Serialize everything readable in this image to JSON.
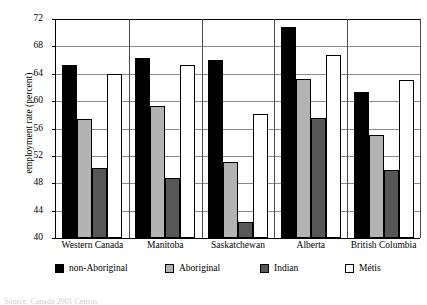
{
  "chart_data": {
    "type": "bar",
    "title": "",
    "xlabel": "",
    "ylabel": "employment rate (percent)",
    "ylim": [
      40,
      72
    ],
    "ytick_step": 4,
    "yticks": [
      72,
      68,
      64,
      60,
      56,
      52,
      48,
      44,
      40
    ],
    "grid": true,
    "legend_position": "bottom",
    "categories": [
      "Western Canada",
      "Manitoba",
      "Saskatchewan",
      "Alberta",
      "British Columbia"
    ],
    "series": [
      {
        "name": "non-Aboriginal",
        "color": "#000000",
        "values": [
          65.0,
          66.0,
          65.7,
          70.5,
          61.0
        ]
      },
      {
        "name": "Aboriginal",
        "color": "#b3b3b3",
        "values": [
          57.1,
          59.0,
          50.8,
          63.0,
          54.7
        ]
      },
      {
        "name": "Indian",
        "color": "#575757",
        "values": [
          50.0,
          48.5,
          42.0,
          57.3,
          49.7
        ]
      },
      {
        "name": "Métis",
        "color": "#ffffff",
        "values": [
          63.7,
          65.0,
          57.8,
          66.5,
          62.8
        ]
      }
    ]
  },
  "axis": {
    "y_title": "employment rate (percent)"
  },
  "footer": {
    "source": "Source: Canada 2001 Census"
  }
}
